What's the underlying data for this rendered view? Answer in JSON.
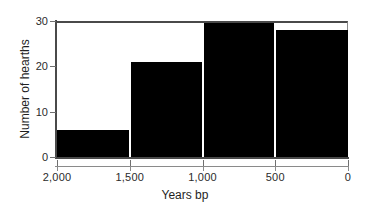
{
  "chart_data": {
    "type": "bar",
    "title": "",
    "subtitle": "",
    "xlabel": "Years bp",
    "ylabel": "Number of hearths",
    "categories": [
      "2,000-1,500",
      "1,500-1,000",
      "1,000-500",
      "500-0"
    ],
    "values": [
      6,
      21,
      29.5,
      28
    ],
    "bin_edges": [
      2000,
      1500,
      1000,
      500,
      0
    ],
    "x_tick_labels": [
      "2,000",
      "1,500",
      "1,000",
      "500",
      "0"
    ],
    "x_tick_values": [
      2000,
      1500,
      1000,
      500,
      0
    ],
    "y_tick_labels": [
      "0",
      "10",
      "20",
      "30"
    ],
    "y_tick_values": [
      0,
      10,
      20,
      30
    ],
    "xlim": [
      2000,
      0
    ],
    "ylim": [
      0,
      30
    ],
    "x_axis_reversed": true,
    "grid": false,
    "legend": false,
    "legend_position": "none",
    "bar_color": "#000000",
    "bar_separator_color": "#ffffff",
    "axis_color": "#4a4a4a",
    "text_color": "#1f1f1f",
    "background_color": "#ffffff",
    "annotations": []
  },
  "axes": {
    "x_title": "Years bp",
    "y_title": "Number of hearths"
  }
}
